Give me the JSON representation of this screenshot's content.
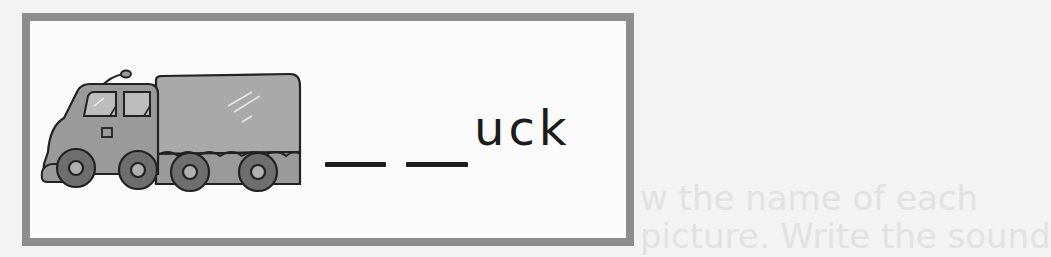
{
  "worksheet": {
    "picture": {
      "subject": "truck",
      "icon": "truck-illustration"
    },
    "blanks": [
      "__",
      "__"
    ],
    "word_suffix": "uck",
    "answer_hidden_letters": 2
  },
  "background_bleed_text": [
    "w the name of each",
    "picture. Write the sound"
  ],
  "colors": {
    "frame": "#8d8d8d",
    "truck_fill": "#9a9a9a",
    "cover_fill": "#a9a9a9",
    "wheel": "#6e6e6e",
    "text": "#1c1c1c"
  }
}
